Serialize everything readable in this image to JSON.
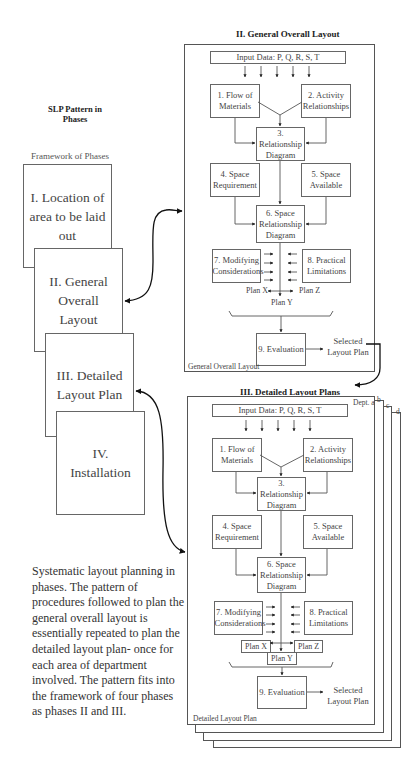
{
  "header": {
    "title_line1": "SLP Pattern in",
    "title_line2": "Phases"
  },
  "framework": {
    "label": "Framework of Phases",
    "phases": [
      {
        "id": "I",
        "label": "I. Location of area to be laid out"
      },
      {
        "id": "II",
        "label": "II. General Overall Layout"
      },
      {
        "id": "III",
        "label": "III. Detailed Layout Plan"
      },
      {
        "id": "IV",
        "label": "IV. Installation"
      }
    ]
  },
  "caption": "Systematic layout planning in phases. The pattern of procedures followed to plan the general overall layout is essentially repeated to plan the detailed layout plan- once for each area of department involved. The pattern fits into the framework of four phases as phases II and III.",
  "general": {
    "title": "II. General Overall Layout",
    "input": "Input Data: P, Q, R, S, T",
    "n1": "1. Flow of Materials",
    "n2": "2. Activity Relationships",
    "n3": "3. Relationship Diagram",
    "n4": "4. Space Requirement",
    "n5": "5. Space Available",
    "n6": "6. Space Relationship Diagram",
    "n7": "7. Modifying Considerations",
    "n8": "8. Practical Limitations",
    "plan_x": "Plan X",
    "plan_y": "Plan Y",
    "plan_z": "Plan Z",
    "n9": "9. Evaluation",
    "selected": "Selected Layout Plan",
    "footer": "General Overall Layout"
  },
  "detailed": {
    "title": "III. Detailed Layout Plans",
    "dept_a": "Dept. a",
    "dept_b": "b",
    "dept_c": "c",
    "dept_d": "d",
    "input": "Input Data: P, Q, R, S, T",
    "n1": "1. Flow of Materials",
    "n2": "2. Activity Relationships",
    "n3": "3. Relationship Diagram",
    "n4": "4. Space Requirement",
    "n5": "5. Space Available",
    "n6": "6. Space Relationship Diagram",
    "n7": "7. Modifying Considerations",
    "n8": "8. Practical Limitations",
    "plan_x": "Plan X",
    "plan_y": "Plan Y",
    "plan_z": "Plan Z",
    "n9": "9. Evaluation",
    "selected": "Selected Layout Plan",
    "footer": "Detailed Layout Plan"
  },
  "colors": {
    "line": "#555555",
    "arrow": "#111111",
    "text": "#444444"
  }
}
